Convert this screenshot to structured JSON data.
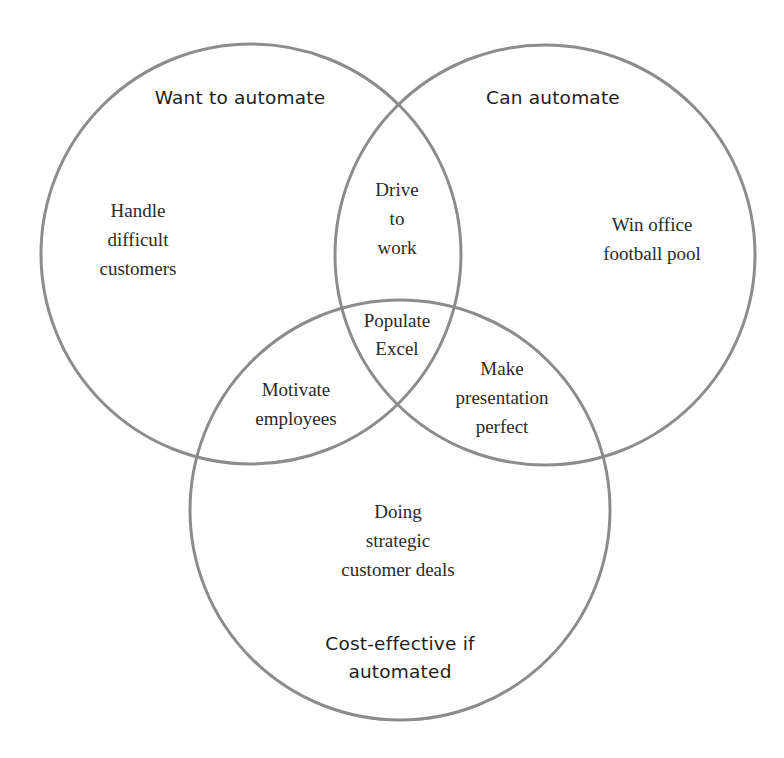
{
  "diagram": {
    "type": "venn",
    "stroke_color": "#8c8c8c",
    "text_color": "#222222",
    "sets": [
      {
        "id": "want",
        "label_lines": [
          "Want to automate"
        ],
        "cx": 251,
        "cy": 254,
        "r": 210
      },
      {
        "id": "can",
        "label_lines": [
          "Can automate"
        ],
        "cx": 545,
        "cy": 255,
        "r": 210
      },
      {
        "id": "cost",
        "label_lines": [
          "Cost-effective if",
          "automated"
        ],
        "cx": 400,
        "cy": 510,
        "r": 210
      }
    ],
    "regions": [
      {
        "sets": [
          "want"
        ],
        "lines": [
          "Handle",
          "difficult",
          "customers"
        ]
      },
      {
        "sets": [
          "can"
        ],
        "lines": [
          "Win office",
          "football pool"
        ]
      },
      {
        "sets": [
          "cost"
        ],
        "lines": [
          "Doing",
          "strategic",
          "customer deals"
        ]
      },
      {
        "sets": [
          "want",
          "can"
        ],
        "lines": [
          "Drive",
          "to",
          "work"
        ]
      },
      {
        "sets": [
          "want",
          "cost"
        ],
        "lines": [
          "Motivate",
          "employees"
        ]
      },
      {
        "sets": [
          "can",
          "cost"
        ],
        "lines": [
          "Make",
          "presentation",
          "perfect"
        ]
      },
      {
        "sets": [
          "want",
          "can",
          "cost"
        ],
        "lines": [
          "Populate",
          "Excel"
        ]
      }
    ]
  }
}
